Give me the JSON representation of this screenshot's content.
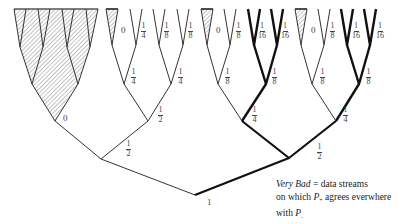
{
  "diagram": {
    "colors": {
      "line": "#333333",
      "bold_line": "#111111",
      "hatch": "#555555"
    },
    "root_label": "1",
    "labels": {
      "left_subtree_zero": "0",
      "level1_half": {
        "num": "1",
        "den": "2"
      },
      "mid_half": {
        "num": "1",
        "den": "2"
      },
      "right_half": {
        "num": "1",
        "den": "2"
      },
      "mid_quarter_left": {
        "num": "1",
        "den": "4"
      },
      "mid_quarter_right": {
        "num": "1",
        "den": "4"
      },
      "mid_leaf_zero": "0",
      "mid_leaf_quarter": {
        "num": "1",
        "den": "4"
      },
      "mid_leaf_eighth_1": {
        "num": "1",
        "den": "8"
      },
      "mid_leaf_eighth_2": {
        "num": "1",
        "den": "8"
      },
      "r1_quarter": {
        "num": "1",
        "den": "4"
      },
      "r1_eighth_left": {
        "num": "1",
        "den": "8"
      },
      "r1_eighth_right": {
        "num": "1",
        "den": "8"
      },
      "r1_leaf_zero": "0",
      "r1_leaf_eighth": {
        "num": "1",
        "den": "8"
      },
      "r1_leaf_16_1": {
        "num": "1",
        "den": "16"
      },
      "r1_leaf_16_2": {
        "num": "1",
        "den": "16"
      },
      "r2_quarter": {
        "num": "1",
        "den": "4"
      },
      "r2_eighth_left": {
        "num": "1",
        "den": "8"
      },
      "r2_eighth_right": {
        "num": "1",
        "den": "8"
      },
      "r2_leaf_zero": "0",
      "r2_leaf_eighth": {
        "num": "1",
        "den": "8"
      },
      "r2_leaf_16_1": {
        "num": "1",
        "den": "16"
      },
      "r2_leaf_16_2": {
        "num": "1",
        "den": "16"
      }
    }
  },
  "caption": {
    "term": "Very Bad",
    "line1_rest": " = data streams",
    "line2_pre": "on which ",
    "p_symbol": "P",
    "p_sub_plus": "+",
    "line2_post": "  agrees everwhere",
    "line3_pre": "with ",
    "p2_sub": "."
  }
}
